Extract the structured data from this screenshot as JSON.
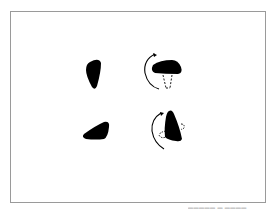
{
  "figure": {
    "type": "mental-rotation-diagram",
    "panels": [
      {
        "id": "top-left",
        "shape": "quadrilateral-blob",
        "rotation_arrow": false
      },
      {
        "id": "top-right",
        "shape": "dome-blob",
        "rotation_arrow": true,
        "arrow_direction": "counterclockwise",
        "dashed_hidden_edge": true
      },
      {
        "id": "bottom-left",
        "shape": "wedge-blob",
        "rotation_arrow": false
      },
      {
        "id": "bottom-right",
        "shape": "triangle-blob",
        "rotation_arrow": true,
        "arrow_direction": "counterclockwise",
        "dashed_hidden_edge": true
      }
    ],
    "colors": {
      "shape_fill": "#000000",
      "border": "#9a9a9a",
      "background": "#ffffff"
    }
  },
  "caption": {
    "text": "▬▬▬▬▬ ▬ ▬▬▬▬"
  }
}
